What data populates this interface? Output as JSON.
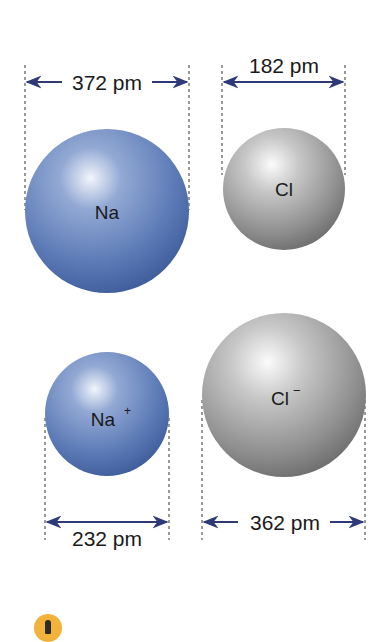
{
  "diagram": {
    "atoms": [
      {
        "id": "na",
        "label": "Na",
        "superscript": "",
        "diameter": "372 pm",
        "color": "#5a79b5"
      },
      {
        "id": "cl",
        "label": "Cl",
        "superscript": "",
        "diameter": "182 pm",
        "color": "#a9a9a9"
      },
      {
        "id": "na_ion",
        "label": "Na",
        "superscript": "+",
        "diameter": "232 pm",
        "color": "#5a79b5"
      },
      {
        "id": "cl_ion",
        "label": "Cl",
        "superscript": "−",
        "diameter": "362 pm",
        "color": "#a9a9a9"
      }
    ],
    "arrow_color": "#2e3a78",
    "footer_icon": "warning-icon"
  }
}
